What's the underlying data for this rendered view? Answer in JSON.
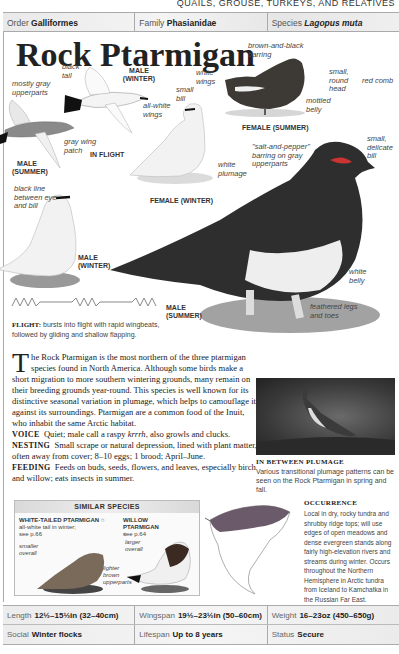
{
  "running_head": "QUAILS, GROUSE, TURKEYS, AND RELATIVES",
  "taxonomy": {
    "order_label": "Order",
    "order_value": "Galliformes",
    "family_label": "Family",
    "family_value": "Phasianidae",
    "species_label": "Species",
    "species_value": "Lagopus muta"
  },
  "title": "Rock Ptarmigan",
  "illustrations": {
    "labels": {
      "black_tail": "black tail",
      "mostly_gray": "mostly gray upperparts",
      "all_white_wings": "all-white wings",
      "gray_wing_patch": "gray wing patch",
      "small_bill": "small bill",
      "white_plumage": "white plumage",
      "black_line": "black line between eye and bill",
      "brown_black_barring": "brown-and-black barring",
      "white_wings": "white wings",
      "mottled_belly": "mottled belly",
      "small_round_head": "small, round head",
      "red_comb": "red comb",
      "small_delicate_bill": "small, delicate bill",
      "salt_pepper": "\"salt-and-pepper\" barring on gray upperparts",
      "white_belly": "white belly",
      "feathered_legs": "feathered legs and toes"
    },
    "captions": {
      "male_winter_flight": "MALE (WINTER)",
      "in_flight": "IN FLIGHT",
      "male_summer_flight": "MALE (SUMMER)",
      "female_winter": "FEMALE (WINTER)",
      "female_summer": "FEMALE (SUMMER)",
      "male_winter": "MALE (WINTER)",
      "male_summer": "MALE (SUMMER)"
    }
  },
  "flight": {
    "label": "FLIGHT:",
    "text": "bursts into flight with rapid wingbeats, followed by gliding and shallow flapping."
  },
  "description": {
    "dropcap": "T",
    "intro": "he Rock Ptarmigan is the most northern of the three ptarmigan species found in North America. Although some birds make a short migration to more southern wintering grounds, many remain on their breeding grounds year-round. This species is well known for its distinctive seasonal variation in plumage, which helps to camouflage it against its surroundings. Ptarmigan are a common food of the Inuit, who inhabit the same Arctic habitat.",
    "voice_label": "VOICE",
    "voice_text_a": "Quiet; male call a raspy ",
    "voice_call": "krrrh",
    "voice_text_b": ", also growls and clucks.",
    "nesting_label": "NESTING",
    "nesting_text": "Small scrape or natural depression, lined with plant matter, often away from cover; 8–10 eggs; 1 brood; April–June.",
    "feeding_label": "FEEDING",
    "feeding_text": "Feeds on buds, seeds, flowers, and leaves, especially birch and willow; eats insects in summer."
  },
  "inset": {
    "title": "IN BETWEEN PLUMAGE",
    "caption": "Various transitional plumage patterns can be seen on the Rock Ptarmigan in spring and fall."
  },
  "similar_species": {
    "heading": "SIMILAR SPECIES",
    "species": [
      {
        "name": "WHITE-TAILED PTARMIGAN ○",
        "note": "all-white tail in winter; see p.66",
        "label1": "smaller overall",
        "label2": "lighter brown upperparts"
      },
      {
        "name": "WILLOW PTARMIGAN ○",
        "note": "see p.64",
        "label1": "larger overall"
      }
    ]
  },
  "occurrence": {
    "title": "OCCURRENCE",
    "text": "Local in dry, rocky tundra and shrubby ridge tops; will use edges of open meadows and dense evergreen stands along fairly high-elevation rivers and streams during winter. Occurs throughout the Northern Hemisphere in Arctic tundra from Iceland to Kamchatka in the Russian Far East."
  },
  "stats": {
    "row1": [
      {
        "label": "Length",
        "value": "12½–15½in (32–40cm)"
      },
      {
        "label": "Wingspan",
        "value": "19½–23½in (50–60cm)"
      },
      {
        "label": "Weight",
        "value": "16–23oz (450–650g)"
      }
    ],
    "row2": [
      {
        "label": "Social",
        "value": "Winter flocks"
      },
      {
        "label": "Lifespan",
        "value": "Up to 8 years"
      },
      {
        "label": "Status",
        "value": "Secure"
      }
    ]
  }
}
